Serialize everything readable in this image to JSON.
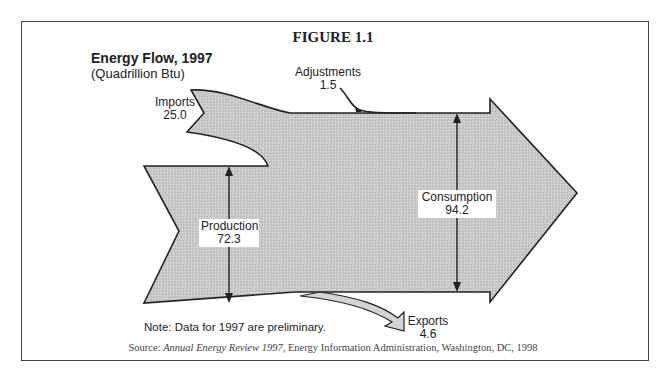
{
  "figure": {
    "label": "FIGURE 1.1",
    "title": "Energy Flow, 1997",
    "subtitle": "(Quadrillion Btu)",
    "note": "Note:  Data for 1997 are preliminary.",
    "source_prefix": "Source: ",
    "source_title": "Annual Energy Review 1997",
    "source_suffix": ", Energy Information Administration, Washington, DC, 1998"
  },
  "flows": {
    "imports": {
      "label": "Imports",
      "value": "25.0"
    },
    "adjustments": {
      "label": "Adjustments",
      "value": "1.5"
    },
    "production": {
      "label": "Production",
      "value": "72.3"
    },
    "consumption": {
      "label": "Consumption",
      "value": "94.2"
    },
    "exports": {
      "label": "Exports",
      "value": "4.6"
    }
  },
  "colors": {
    "flow_fill": "#c8c8c8",
    "outline": "#222222",
    "border": "#444444"
  }
}
